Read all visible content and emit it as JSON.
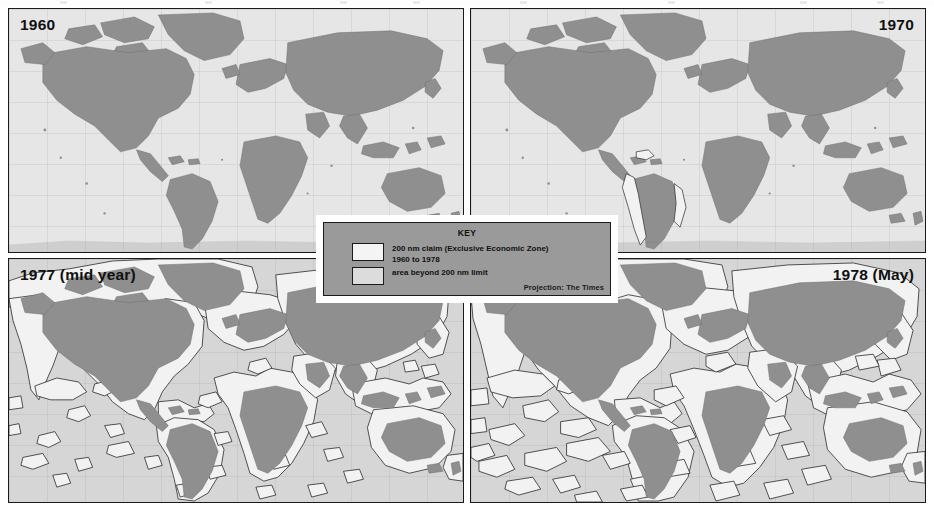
{
  "figure": {
    "type": "map-series",
    "projection_note": "Projection: The Times",
    "panels": [
      {
        "id": "panel-1960",
        "label": "1960",
        "label_side": "left",
        "position": "top-left"
      },
      {
        "id": "panel-1970",
        "label": "1970",
        "label_side": "right",
        "position": "top-right"
      },
      {
        "id": "panel-1977",
        "label": "1977 (mid year)",
        "label_side": "left",
        "position": "bottom-left"
      },
      {
        "id": "panel-1978",
        "label": "1978 (May)",
        "label_side": "right",
        "position": "bottom-right"
      }
    ]
  },
  "key": {
    "title": "KEY",
    "entries": [
      {
        "swatch": "eez",
        "line1": "200 nm claim (Exclusive Economic Zone)",
        "line2": "1960 to 1978"
      },
      {
        "swatch": "beyond",
        "line1": "area beyond 200 nm limit",
        "line2": ""
      }
    ],
    "projection": "Projection: The Times"
  },
  "colors": {
    "land": "#8f8f8f",
    "eez_zone": "#f2f2f2",
    "ocean_beyond": "#d9d9d9",
    "outline": "#2a2a2a",
    "panel_border": "#1a1a1a",
    "key_background": "#9a9a9a",
    "page_background": "#ffffff",
    "text": "#101010"
  }
}
